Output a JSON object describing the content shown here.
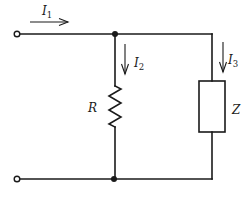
{
  "diagram": {
    "type": "circuit-schematic",
    "components": [
      {
        "id": "R",
        "kind": "resistor",
        "label": "R"
      },
      {
        "id": "Z",
        "kind": "impedance",
        "label": "Z"
      }
    ],
    "currents": [
      {
        "id": "I1",
        "symbol": "I",
        "subscript": "1",
        "direction": "right",
        "location": "input-top-wire"
      },
      {
        "id": "I2",
        "symbol": "I",
        "subscript": "2",
        "direction": "down",
        "location": "resistor-branch"
      },
      {
        "id": "I3",
        "symbol": "I",
        "subscript": "3",
        "direction": "down",
        "location": "impedance-branch"
      }
    ],
    "terminals": [
      {
        "id": "terminal-top",
        "kind": "open-circle"
      },
      {
        "id": "terminal-bottom",
        "kind": "open-circle"
      }
    ],
    "junctions": [
      {
        "id": "junction-top",
        "kind": "filled-dot"
      },
      {
        "id": "junction-bottom",
        "kind": "filled-dot"
      }
    ]
  },
  "labels": {
    "R": "R",
    "Z": "Z",
    "I1_main": "I",
    "I1_sub": "1",
    "I2_main": "I",
    "I2_sub": "2",
    "I3_main": "I",
    "I3_sub": "3"
  },
  "colors": {
    "line": "#1a1a1a",
    "background": "#ffffff"
  }
}
